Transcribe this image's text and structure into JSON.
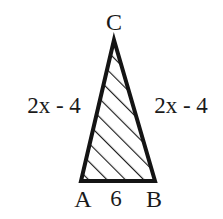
{
  "figure": {
    "name": "isosceles-triangle-with-algebraic-side-labels",
    "background_color": "#ffffff",
    "stroke_color": "#141414",
    "hatch_color": "#1a1a1a",
    "vertices": {
      "apex_label": "C",
      "base_left_label": "A",
      "base_right_label": "B"
    },
    "side_labels": {
      "left_leg": "2x - 4",
      "right_leg": "2x - 4",
      "base": "6"
    },
    "geometry": {
      "apex_x": 114,
      "apex_y": 40,
      "base_left_x": 81,
      "base_right_x": 155,
      "base_y": 181,
      "hatch_angle_degrees": 45,
      "hatch_spacing_px": 13,
      "outline_width_px": 4
    }
  }
}
